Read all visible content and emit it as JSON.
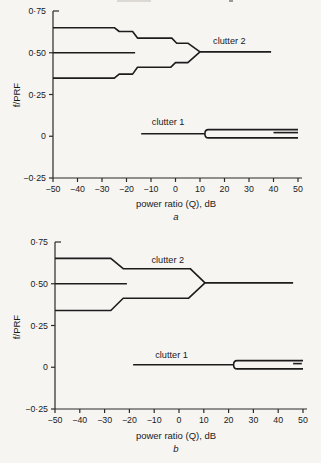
{
  "page": {
    "background": "#f6f5f2",
    "line_color": "#1c1c1c",
    "axis_color": "#2a2a2a",
    "text_color": "#1a1a1a",
    "artifacts": [
      {
        "x": 117,
        "y": 0,
        "w": 34,
        "h": 2,
        "color": "#dcd9d4"
      },
      {
        "x": 229,
        "y": 0,
        "w": 4,
        "h": 2,
        "color": "#9a9a98"
      }
    ]
  },
  "chart_data": [
    {
      "id": "a",
      "type": "line",
      "svg_id": "svg-a",
      "caption": "a",
      "xlabel": "power ratio (Q), dB",
      "ylabel": "f/PRF",
      "xlim": [
        -50,
        50
      ],
      "ylim": [
        -0.25,
        0.75
      ],
      "grid": false,
      "plot": {
        "left": 53,
        "right": 298,
        "top": 11,
        "bottom": 178
      },
      "x_ticks": [
        {
          "v": -50,
          "label": "−50"
        },
        {
          "v": -40,
          "label": "−40"
        },
        {
          "v": -30,
          "label": "−30"
        },
        {
          "v": -20,
          "label": "−20"
        },
        {
          "v": -10,
          "label": "−10"
        },
        {
          "v": 0,
          "label": "0"
        },
        {
          "v": 10,
          "label": "10"
        },
        {
          "v": 20,
          "label": "20"
        },
        {
          "v": 30,
          "label": "30"
        },
        {
          "v": 40,
          "label": "40"
        },
        {
          "v": 50,
          "label": "50"
        }
      ],
      "y_ticks": [
        {
          "v": 0.75,
          "label": "0·75"
        },
        {
          "v": 0.5,
          "label": "0·50"
        },
        {
          "v": 0.25,
          "label": "0·25"
        },
        {
          "v": 0,
          "label": "0"
        },
        {
          "v": -0.25,
          "label": "−0·25"
        }
      ],
      "series": [
        {
          "name": "clutter2-upper-boundary",
          "points": [
            [
              -50,
              0.65
            ],
            [
              -25,
              0.65
            ],
            [
              -23,
              0.627
            ],
            [
              -17.5,
              0.627
            ],
            [
              -15.5,
              0.588
            ],
            [
              -1.5,
              0.588
            ],
            [
              0.5,
              0.557
            ],
            [
              5,
              0.557
            ],
            [
              10,
              0.505
            ]
          ]
        },
        {
          "name": "clutter2-lower-boundary",
          "points": [
            [
              -50,
              0.348
            ],
            [
              -25,
              0.348
            ],
            [
              -23,
              0.372
            ],
            [
              -17.5,
              0.372
            ],
            [
              -15.5,
              0.413
            ],
            [
              -2,
              0.413
            ],
            [
              0,
              0.441
            ],
            [
              5,
              0.441
            ],
            [
              10,
              0.505
            ]
          ]
        },
        {
          "name": "clutter2-center-line",
          "points": [
            [
              -50,
              0.5
            ],
            [
              -16.5,
              0.5
            ]
          ]
        },
        {
          "name": "clutter2-merged-line",
          "points": [
            [
              10,
              0.505
            ],
            [
              39,
              0.505
            ]
          ]
        },
        {
          "name": "clutter1-main-line",
          "points": [
            [
              -14,
              0.015
            ],
            [
              12,
              0.015
            ]
          ]
        },
        {
          "name": "clutter1-short-line",
          "points": [
            [
              40,
              0.022
            ],
            [
              50,
              0.022
            ]
          ]
        }
      ],
      "forks": [
        {
          "name": "clutter1-split-band",
          "x_cap": 12,
          "x_end": 50,
          "y_upper": 0.04,
          "y_lower": -0.01
        }
      ],
      "annotations": [
        {
          "name": "clutter-2-label",
          "text": "clutter 2",
          "x": 22,
          "y": 0.57
        },
        {
          "name": "clutter-1-label",
          "text": "clutter 1",
          "x": -3,
          "y": 0.085
        }
      ]
    },
    {
      "id": "b",
      "type": "line",
      "svg_id": "svg-b",
      "caption": "b",
      "xlabel": "power ratio (Q), dB",
      "ylabel": "f/PRF",
      "xlim": [
        -50,
        50
      ],
      "ylim": [
        -0.25,
        0.75
      ],
      "grid": false,
      "plot": {
        "left": 55,
        "right": 303,
        "top": 10,
        "bottom": 177
      },
      "x_ticks": [
        {
          "v": -50,
          "label": "−50"
        },
        {
          "v": -40,
          "label": "−40"
        },
        {
          "v": -30,
          "label": "−30"
        },
        {
          "v": -20,
          "label": "−20"
        },
        {
          "v": -10,
          "label": "−10"
        },
        {
          "v": 0,
          "label": "0"
        },
        {
          "v": 10,
          "label": "10"
        },
        {
          "v": 20,
          "label": "20"
        },
        {
          "v": 30,
          "label": "30"
        },
        {
          "v": 40,
          "label": "40"
        },
        {
          "v": 50,
          "label": "50"
        }
      ],
      "y_ticks": [
        {
          "v": 0.75,
          "label": "0·75"
        },
        {
          "v": 0.5,
          "label": "0·50"
        },
        {
          "v": 0.25,
          "label": "0·25"
        },
        {
          "v": 0,
          "label": "0"
        },
        {
          "v": -0.25,
          "label": "−0·25"
        }
      ],
      "series": [
        {
          "name": "clutter2-upper-boundary",
          "points": [
            [
              -50,
              0.652
            ],
            [
              -27.5,
              0.652
            ],
            [
              -22.5,
              0.59
            ],
            [
              4.5,
              0.59
            ],
            [
              10.5,
              0.505
            ]
          ]
        },
        {
          "name": "clutter2-lower-boundary",
          "points": [
            [
              -50,
              0.34
            ],
            [
              -27.5,
              0.34
            ],
            [
              -22.5,
              0.413
            ],
            [
              3.8,
              0.413
            ],
            [
              10.5,
              0.505
            ]
          ]
        },
        {
          "name": "clutter2-center-line",
          "points": [
            [
              -50,
              0.5
            ],
            [
              -21,
              0.5
            ]
          ]
        },
        {
          "name": "clutter2-merged-line",
          "points": [
            [
              10.5,
              0.505
            ],
            [
              46,
              0.505
            ]
          ]
        },
        {
          "name": "clutter1-main-line",
          "points": [
            [
              -18.5,
              0.015
            ],
            [
              22,
              0.015
            ]
          ]
        },
        {
          "name": "clutter1-short-dash",
          "points": [
            [
              46,
              0.022
            ],
            [
              49.5,
              0.022
            ]
          ]
        }
      ],
      "forks": [
        {
          "name": "clutter1-split-band",
          "x_cap": 22,
          "x_end": 50,
          "y_upper": 0.04,
          "y_lower": -0.01
        }
      ],
      "annotations": [
        {
          "name": "clutter-2-label",
          "text": "clutter 2",
          "x": -4.5,
          "y": 0.645
        },
        {
          "name": "clutter-1-label",
          "text": "clutter 1",
          "x": -3,
          "y": 0.075
        }
      ]
    }
  ]
}
